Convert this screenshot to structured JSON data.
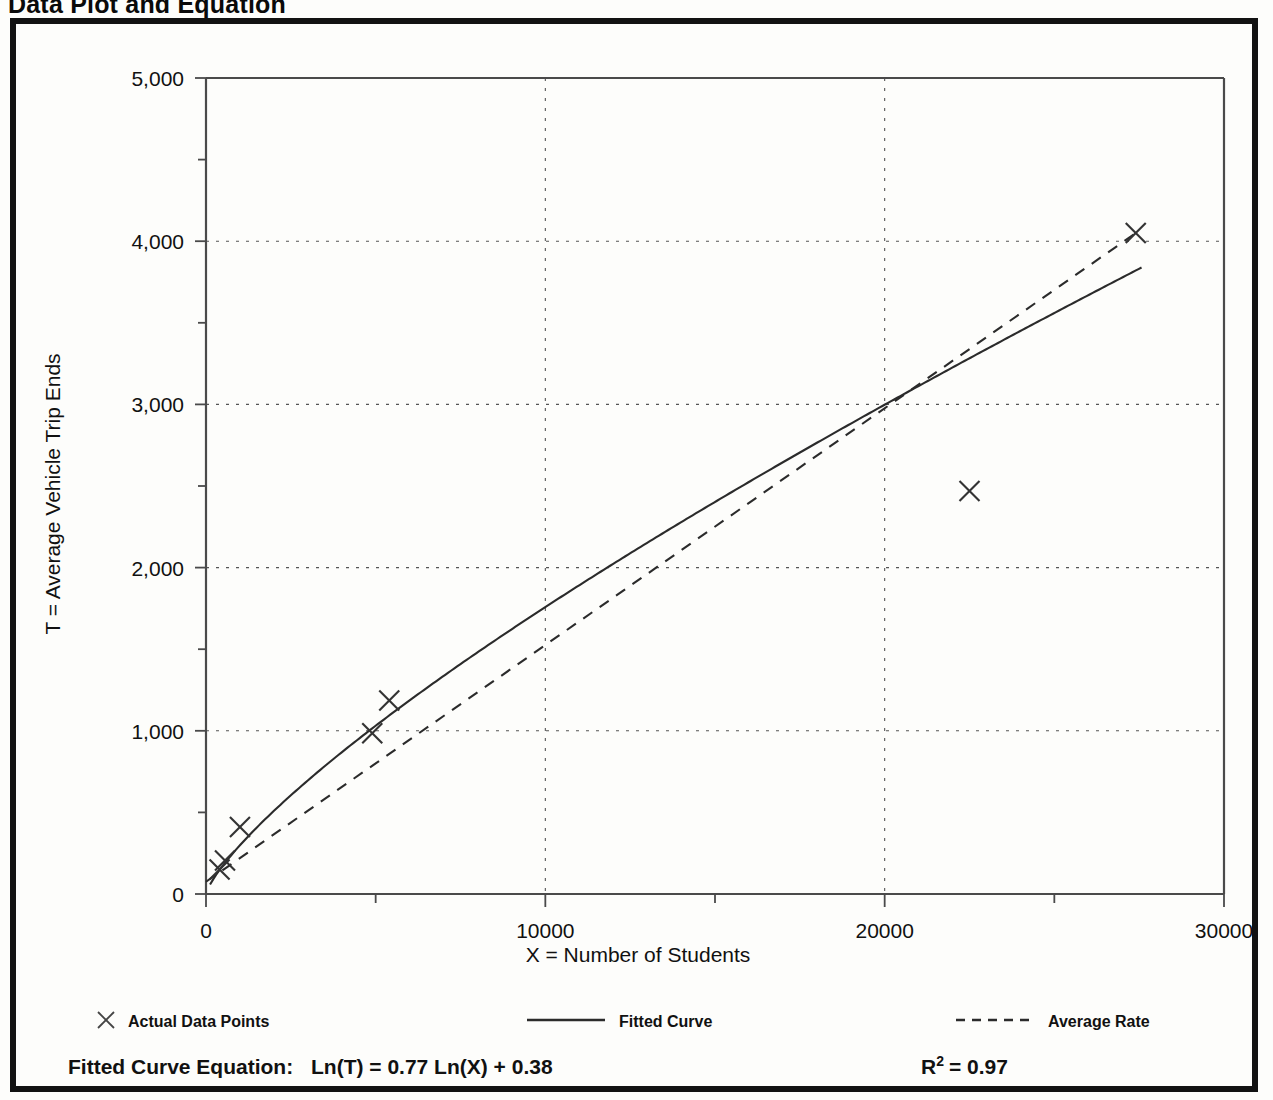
{
  "page": {
    "title": "Data Plot and Equation"
  },
  "chart_data": {
    "type": "scatter",
    "title": "Data Plot and Equation",
    "xlabel": "X = Number of Students",
    "ylabel": "T = Average Vehicle Trip Ends",
    "xlim": [
      0,
      30000
    ],
    "ylim": [
      0,
      5000
    ],
    "grid": true,
    "x_ticks": [
      0,
      10000,
      20000,
      30000
    ],
    "x_tick_labels": [
      "0",
      "10000",
      "20000",
      "30000"
    ],
    "x_minor_ticks": [
      5000,
      15000,
      25000
    ],
    "y_ticks": [
      0,
      1000,
      2000,
      3000,
      4000,
      5000
    ],
    "y_tick_labels": [
      "0",
      "1,000",
      "2,000",
      "3,000",
      "4,000",
      "5,000"
    ],
    "y_minor_ticks": [
      500,
      1500,
      2500,
      3500,
      4500
    ],
    "legend_position": "below-axis",
    "series": [
      {
        "name": "Actual Data Points",
        "style": "marker-x",
        "points": [
          {
            "x": 400,
            "y": 150
          },
          {
            "x": 560,
            "y": 205
          },
          {
            "x": 1000,
            "y": 410
          },
          {
            "x": 4900,
            "y": 985
          },
          {
            "x": 5400,
            "y": 1185
          },
          {
            "x": 22500,
            "y": 2470
          },
          {
            "x": 27400,
            "y": 4050
          }
        ]
      },
      {
        "name": "Fitted Curve",
        "style": "solid-line",
        "equation": "Ln(T) = 0.77 Ln(X) + 0.38",
        "coefficient": 1.4623,
        "exponent": 0.77
      },
      {
        "name": "Average Rate",
        "style": "dashed-line",
        "points": [
          {
            "x": 0,
            "y": 75
          },
          {
            "x": 27400,
            "y": 4050
          }
        ]
      }
    ]
  },
  "legend": {
    "items": [
      {
        "label": "Actual Data Points",
        "marker": "x-marker-icon"
      },
      {
        "label": "Fitted Curve",
        "marker": "solid-line-icon"
      },
      {
        "label": "Average Rate",
        "marker": "dashed-line-icon"
      }
    ]
  },
  "equation_row": {
    "label": "Fitted Curve Equation:",
    "expression": "Ln(T) = 0.77 Ln(X) + 0.38",
    "r_symbol": "R",
    "r_exponent": "2",
    "r_value": "= 0.97"
  }
}
